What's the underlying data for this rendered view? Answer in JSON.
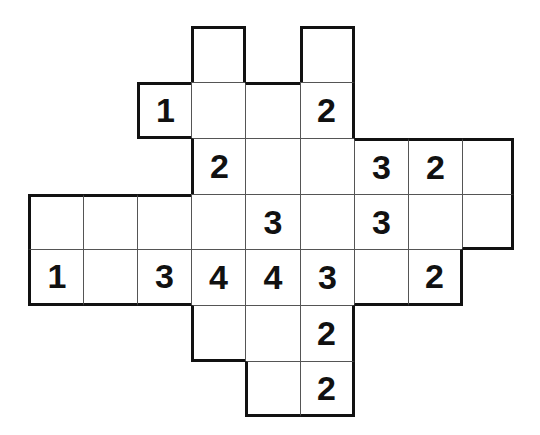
{
  "puzzle": {
    "type": "number-grid-puzzle",
    "grid_origin": {
      "x": 28,
      "y": 26
    },
    "col_edges": [
      28,
      83,
      137,
      191,
      245,
      300,
      354,
      408,
      462,
      513
    ],
    "row_edges": [
      26,
      82,
      138,
      194,
      249,
      305,
      361,
      416
    ],
    "line_color": "#555555",
    "border_color": "#111111",
    "rows": [
      {
        "row": 0,
        "cells": [
          {
            "col": 3,
            "value": ""
          },
          {
            "col": 5,
            "value": ""
          }
        ]
      },
      {
        "row": 1,
        "cells": [
          {
            "col": 2,
            "value": "1"
          },
          {
            "col": 3,
            "value": ""
          },
          {
            "col": 4,
            "value": ""
          },
          {
            "col": 5,
            "value": "2"
          }
        ]
      },
      {
        "row": 2,
        "cells": [
          {
            "col": 3,
            "value": "2"
          },
          {
            "col": 4,
            "value": ""
          },
          {
            "col": 5,
            "value": ""
          },
          {
            "col": 6,
            "value": "3"
          },
          {
            "col": 7,
            "value": "2"
          },
          {
            "col": 8,
            "value": ""
          }
        ]
      },
      {
        "row": 3,
        "cells": [
          {
            "col": 0,
            "value": ""
          },
          {
            "col": 1,
            "value": ""
          },
          {
            "col": 2,
            "value": ""
          },
          {
            "col": 3,
            "value": ""
          },
          {
            "col": 4,
            "value": "3"
          },
          {
            "col": 5,
            "value": ""
          },
          {
            "col": 6,
            "value": "3"
          },
          {
            "col": 7,
            "value": ""
          },
          {
            "col": 8,
            "value": ""
          }
        ]
      },
      {
        "row": 4,
        "cells": [
          {
            "col": 0,
            "value": "1"
          },
          {
            "col": 1,
            "value": ""
          },
          {
            "col": 2,
            "value": "3"
          },
          {
            "col": 3,
            "value": "4"
          },
          {
            "col": 4,
            "value": "4"
          },
          {
            "col": 5,
            "value": "3"
          },
          {
            "col": 6,
            "value": ""
          },
          {
            "col": 7,
            "value": "2"
          }
        ]
      },
      {
        "row": 5,
        "cells": [
          {
            "col": 3,
            "value": ""
          },
          {
            "col": 4,
            "value": ""
          },
          {
            "col": 5,
            "value": "2"
          }
        ]
      },
      {
        "row": 6,
        "cells": [
          {
            "col": 4,
            "value": ""
          },
          {
            "col": 5,
            "value": "2"
          }
        ]
      }
    ]
  }
}
